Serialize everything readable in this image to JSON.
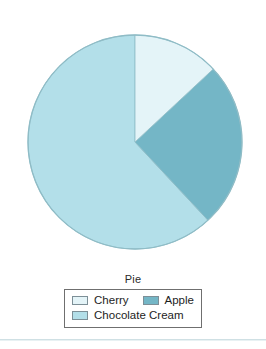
{
  "chart_data": {
    "type": "pie",
    "title": "Pie",
    "categories": [
      "Cherry",
      "Apple",
      "Chocolate Cream"
    ],
    "values": [
      13,
      25,
      62
    ],
    "value_unit": "percent",
    "angles_deg": [
      47,
      90,
      223
    ],
    "start_angle_deg": 0,
    "direction": "clockwise",
    "colors": [
      "#e4f4f8",
      "#74b6c6",
      "#b3dfe9"
    ],
    "legend_position": "bottom",
    "legend_title": "Pie",
    "grid": false,
    "xlabel": "",
    "ylabel": ""
  },
  "legend": {
    "title": "Pie",
    "rows": [
      [
        {
          "label": "Cherry",
          "color": "#e4f4f8"
        },
        {
          "label": "Apple",
          "color": "#74b6c6"
        }
      ],
      [
        {
          "label": "Chocolate Cream",
          "color": "#b3dfe9"
        }
      ]
    ]
  },
  "pie": {
    "center_x": 135,
    "center_y": 142,
    "radius": 107,
    "outline_color": "#8fbcc6",
    "slices": [
      {
        "name": "Cherry",
        "color": "#e4f4f8",
        "start": 0,
        "end": 47
      },
      {
        "name": "Apple",
        "color": "#74b6c6",
        "start": 47,
        "end": 137
      },
      {
        "name": "Chocolate Cream",
        "color": "#b3dfe9",
        "start": 137,
        "end": 360
      }
    ]
  }
}
